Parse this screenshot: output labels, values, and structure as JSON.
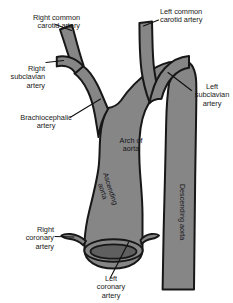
{
  "figure": {
    "background_color": "#ffffff",
    "vessel_fill_color": "#868686",
    "vessel_outline_color": "#171717",
    "lumen_fill_color": "#5f5f5f",
    "text_color": "#1a1a1a"
  },
  "labels": {
    "right_common_carotid": "Right common\ncarotid artery",
    "left_common_carotid": "Left common\ncarotid artery",
    "right_subclavian": "Right\nsubclavian\nartery",
    "left_subclavian": "Left\nsubclavian\nartery",
    "brachiocephalic": "Brachiocephalic\nartery",
    "arch_of_aorta": "Arch of\naorta",
    "ascending_aorta": "Ascending\naorta",
    "descending_aorta": "Descending aorta",
    "right_coronary": "Right\ncoronary\nartery",
    "left_coronary": "Left\ncoronary\nartery"
  },
  "structures": [
    {
      "name": "right-common-carotid-artery",
      "type": "branch-vessel"
    },
    {
      "name": "left-common-carotid-artery",
      "type": "branch-vessel"
    },
    {
      "name": "right-subclavian-artery",
      "type": "branch-vessel"
    },
    {
      "name": "left-subclavian-artery",
      "type": "branch-vessel"
    },
    {
      "name": "brachiocephalic-artery",
      "type": "branch-vessel"
    },
    {
      "name": "arch-of-aorta",
      "type": "main-vessel"
    },
    {
      "name": "ascending-aorta",
      "type": "main-vessel"
    },
    {
      "name": "descending-aorta",
      "type": "main-vessel"
    },
    {
      "name": "aortic-root-opening",
      "type": "lumen"
    },
    {
      "name": "right-coronary-artery",
      "type": "branch-vessel"
    },
    {
      "name": "left-coronary-artery",
      "type": "branch-vessel"
    }
  ]
}
